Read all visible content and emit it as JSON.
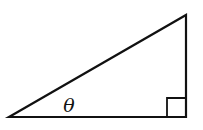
{
  "diagram": {
    "type": "right-triangle",
    "stroke_color": "#111111",
    "background_color": "#ffffff",
    "vertices": {
      "left": [
        9,
        117
      ],
      "top_right": [
        186,
        15
      ],
      "bottom_right": [
        186,
        117
      ]
    },
    "right_angle_marker": {
      "corner": "bottom_right",
      "size": 19
    },
    "angle_label": {
      "text": "θ",
      "position": [
        69,
        111
      ],
      "at_vertex": "left"
    }
  }
}
